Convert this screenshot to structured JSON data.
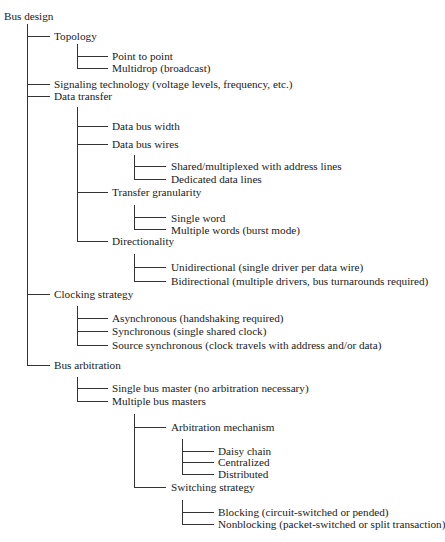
{
  "title": "Bus design",
  "tree": {
    "topology": {
      "label": "Topology",
      "children": [
        "Point to point",
        "Multidrop (broadcast)"
      ]
    },
    "signaling": {
      "label": "Signaling technology (voltage levels, frequency, etc.)"
    },
    "data_transfer": {
      "label": "Data transfer",
      "width": {
        "label": "Data bus width"
      },
      "wires": {
        "label": "Data bus wires",
        "children": [
          "Shared/multiplexed with address lines",
          "Dedicated data lines"
        ]
      },
      "granularity": {
        "label": "Transfer granularity",
        "children": [
          "Single word",
          "Multiple words (burst mode)"
        ]
      },
      "directionality": {
        "label": "Directionality",
        "children": [
          "Unidirectional (single driver per data wire)",
          "Bidirectional (multiple drivers, bus turnarounds required)"
        ]
      }
    },
    "clocking": {
      "label": "Clocking strategy",
      "children": [
        "Asynchronous (handshaking required)",
        "Synchronous (single shared clock)",
        "Source synchronous (clock travels with address and/or data)"
      ]
    },
    "arbitration": {
      "label": "Bus arbitration",
      "single": {
        "label": "Single bus master (no arbitration necessary)"
      },
      "multiple": {
        "label": "Multiple bus masters",
        "mechanism": {
          "label": "Arbitration mechanism",
          "children": [
            "Daisy chain",
            "Centralized",
            "Distributed"
          ]
        },
        "switching": {
          "label": "Switching strategy",
          "children": [
            "Blocking (circuit-switched or pended)",
            "Nonblocking (packet-switched or split transaction)"
          ]
        }
      }
    }
  }
}
